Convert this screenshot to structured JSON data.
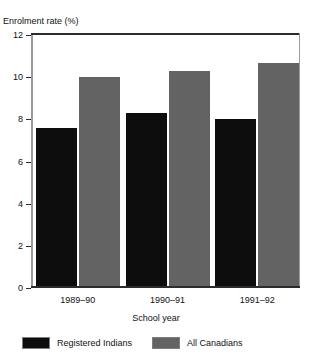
{
  "figure": {
    "title_remnant": "",
    "series_colors": [
      "#0d0d0d",
      "#636363"
    ]
  },
  "chart_data": {
    "type": "bar",
    "title": "",
    "xlabel": "School year",
    "ylabel": "Enrolment rate (%)",
    "categories": [
      "1989–90",
      "1990–91",
      "1991–92"
    ],
    "series": [
      {
        "name": "Registered Indians",
        "color": "#0d0d0d",
        "values": [
          7.5,
          8.2,
          7.9
        ]
      },
      {
        "name": "All Canadians",
        "color": "#636363",
        "values": [
          9.9,
          10.2,
          10.6
        ]
      }
    ],
    "ylim": [
      0,
      12
    ],
    "yticks": [
      0,
      2,
      4,
      6,
      8,
      10,
      12
    ],
    "ytick_labels": [
      "0",
      "2",
      "4",
      "6",
      "8",
      "10",
      "12"
    ],
    "grid": false,
    "legend_position": "bottom"
  }
}
